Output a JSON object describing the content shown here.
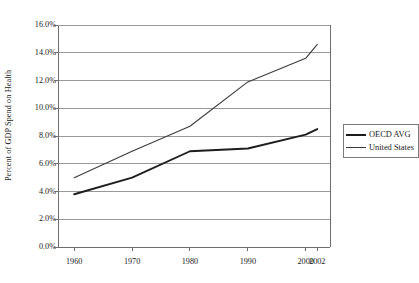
{
  "chart_data": {
    "type": "line",
    "title": "",
    "xlabel": "",
    "ylabel": "Percent of GDP Spend on Health",
    "categories": [
      "1960",
      "1970",
      "1980",
      "1990",
      "2000",
      "2002"
    ],
    "x": [
      1960,
      1970,
      1980,
      1990,
      2000,
      2002
    ],
    "series": [
      {
        "name": "OECD AVG",
        "values": [
          3.8,
          5.0,
          6.9,
          7.1,
          8.1,
          8.5
        ],
        "style": "thick-line"
      },
      {
        "name": "United States",
        "values": [
          5.0,
          6.9,
          8.7,
          11.9,
          13.6,
          14.6
        ],
        "style": "thin-line"
      }
    ],
    "ylim": [
      0.0,
      16.0
    ],
    "ytick_values": [
      0.0,
      2.0,
      4.0,
      6.0,
      8.0,
      10.0,
      12.0,
      14.0,
      16.0
    ],
    "ytick_labels": [
      "0.0%",
      "2.0%",
      "4.0%",
      "6.0%",
      "8.0%",
      "10.0%",
      "12.0%",
      "14.0%",
      "16.0%"
    ],
    "grid": "horizontal",
    "legend_position": "right-outside"
  },
  "legend": {
    "entries": [
      {
        "label": "OECD AVG"
      },
      {
        "label": "United States"
      }
    ]
  },
  "colors": {
    "series_oecd": "#1d1d1d",
    "series_us": "#3a3a3a",
    "gridline": "#999999",
    "axis": "#6e6e6e",
    "text": "#1a1a1a",
    "background": "#ffffff"
  }
}
